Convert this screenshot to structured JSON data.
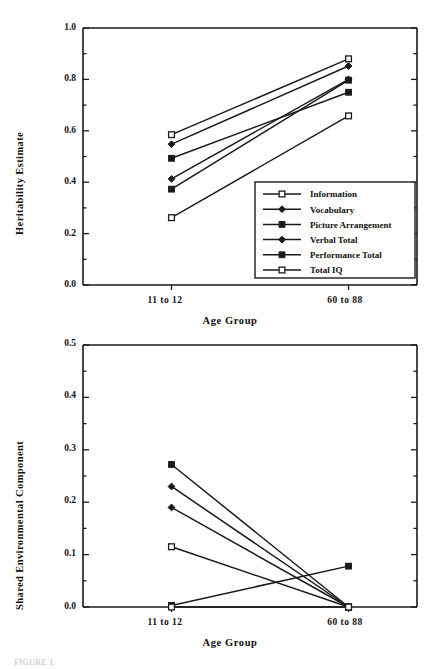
{
  "figure": {
    "footer_note": "FIGURE 1."
  },
  "chart_data": [
    {
      "id": "heritability",
      "type": "line",
      "title": "",
      "xlabel": "Age  Group",
      "ylabel": "Heritability  Estimate",
      "categories": [
        "11 to 12",
        "60 to 88"
      ],
      "x_tick_labels": [
        "11  to  12",
        "60  to  88"
      ],
      "y_tick_labels": [
        "0.0",
        "0.2",
        "0.4",
        "0.6",
        "0.8",
        "1.0"
      ],
      "y_ticks": [
        0.0,
        0.2,
        0.4,
        0.6,
        0.8,
        1.0
      ],
      "ylim": [
        0.0,
        1.0
      ],
      "grid": false,
      "legend_position": "lower-right-inside",
      "series": [
        {
          "name": "Information",
          "marker": "open-square",
          "values": [
            0.585,
            0.88
          ]
        },
        {
          "name": "Vocabulary",
          "marker": "filled-diamond",
          "values": [
            0.548,
            0.852
          ]
        },
        {
          "name": "Picture Arrangement",
          "marker": "filled-square",
          "values": [
            0.493,
            0.75
          ]
        },
        {
          "name": "Verbal Total",
          "marker": "filled-diamond",
          "values": [
            0.413,
            0.8
          ]
        },
        {
          "name": "Performance Total",
          "marker": "filled-square",
          "values": [
            0.373,
            0.797
          ]
        },
        {
          "name": "Total IQ",
          "marker": "open-square",
          "values": [
            0.262,
            0.658
          ]
        }
      ]
    },
    {
      "id": "shared-environment",
      "type": "line",
      "title": "",
      "xlabel": "Age  Group",
      "ylabel": "Shared  Environmental  Component",
      "categories": [
        "11 to 12",
        "60 to 88"
      ],
      "x_tick_labels": [
        "11  to  12",
        "60  to  88"
      ],
      "y_tick_labels": [
        "0.0",
        "0.1",
        "0.2",
        "0.3",
        "0.4",
        "0.5"
      ],
      "y_ticks": [
        0.0,
        0.1,
        0.2,
        0.3,
        0.4,
        0.5
      ],
      "ylim": [
        0.0,
        0.5
      ],
      "grid": false,
      "legend_position": "none",
      "series": [
        {
          "name": "Information",
          "marker": "filled-square",
          "values": [
            0.272,
            0.0
          ]
        },
        {
          "name": "Vocabulary",
          "marker": "filled-diamond",
          "values": [
            0.23,
            0.0
          ]
        },
        {
          "name": "Picture Arrangement",
          "marker": "filled-diamond",
          "values": [
            0.19,
            0.0
          ]
        },
        {
          "name": "Verbal Total",
          "marker": "open-square",
          "values": [
            0.115,
            0.0
          ]
        },
        {
          "name": "Performance Total",
          "marker": "filled-square",
          "values": [
            0.003,
            0.078
          ]
        },
        {
          "name": "Total IQ",
          "marker": "open-square",
          "values": [
            0.0,
            0.0
          ]
        }
      ]
    }
  ],
  "legend": {
    "items": [
      {
        "label": "Information",
        "marker": "open-square"
      },
      {
        "label": "Vocabulary",
        "marker": "filled-diamond"
      },
      {
        "label": "Picture Arrangement",
        "marker": "filled-square"
      },
      {
        "label": "Verbal Total",
        "marker": "filled-diamond"
      },
      {
        "label": "Performance Total",
        "marker": "filled-square"
      },
      {
        "label": "Total IQ",
        "marker": "open-square"
      }
    ]
  },
  "colors": {
    "line": "#1a1a1a",
    "axis": "#1a1a1a",
    "text": "#111111",
    "background": "#ffffff"
  }
}
